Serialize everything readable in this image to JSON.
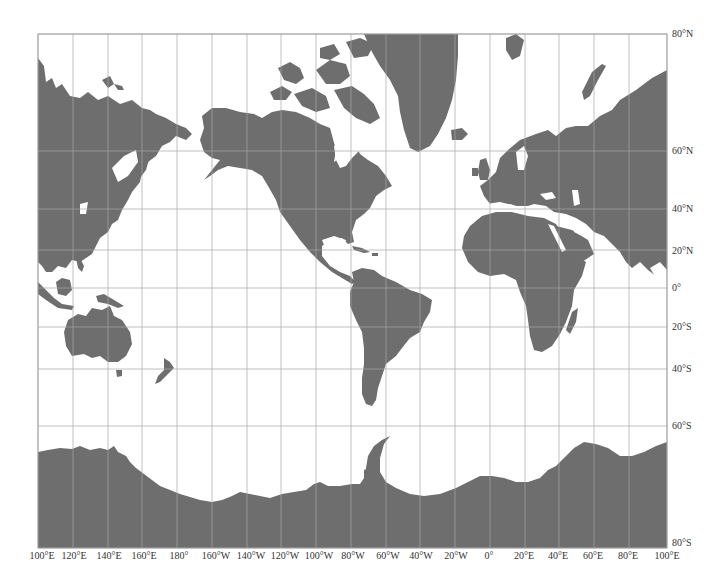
{
  "map": {
    "projection": "Mercator",
    "land_color": "#6e6e6e",
    "ocean_color": "#ffffff",
    "grid_color": "#b8b8b8",
    "frame": {
      "left": 38,
      "top": 34,
      "right": 667,
      "bottom": 548
    }
  },
  "longitude_labels": [
    {
      "text": "100°E",
      "x": 42
    },
    {
      "text": "120°E",
      "x": 74
    },
    {
      "text": "140°E",
      "x": 109
    },
    {
      "text": "160°E",
      "x": 144
    },
    {
      "text": "180°",
      "x": 179
    },
    {
      "text": "160°W",
      "x": 216
    },
    {
      "text": "140°W",
      "x": 251
    },
    {
      "text": "120°W",
      "x": 285
    },
    {
      "text": "100°W",
      "x": 319
    },
    {
      "text": "80°W",
      "x": 353
    },
    {
      "text": "60°W",
      "x": 388
    },
    {
      "text": "40°W",
      "x": 421
    },
    {
      "text": "20°W",
      "x": 456
    },
    {
      "text": "0°",
      "x": 489
    },
    {
      "text": "20°E",
      "x": 524
    },
    {
      "text": "40°E",
      "x": 558
    },
    {
      "text": "60°E",
      "x": 593
    },
    {
      "text": "80°E",
      "x": 628
    },
    {
      "text": "100°E",
      "x": 667
    }
  ],
  "latitude_labels": [
    {
      "text": "80°N",
      "y": 34
    },
    {
      "text": "60°N",
      "y": 151
    },
    {
      "text": "40°N",
      "y": 209
    },
    {
      "text": "20°N",
      "y": 251
    },
    {
      "text": "0°",
      "y": 288
    },
    {
      "text": "20°S",
      "y": 327
    },
    {
      "text": "40°S",
      "y": 369
    },
    {
      "text": "60°S",
      "y": 426
    },
    {
      "text": "80°S",
      "y": 543
    }
  ],
  "grid": {
    "meridians_x": [
      38,
      73,
      108,
      142,
      177,
      212,
      247,
      281,
      316,
      351,
      386,
      420,
      455,
      490,
      525,
      559,
      594,
      629,
      667
    ],
    "parallels_y": [
      34,
      151,
      209,
      250,
      288,
      327,
      369,
      426,
      548
    ]
  }
}
